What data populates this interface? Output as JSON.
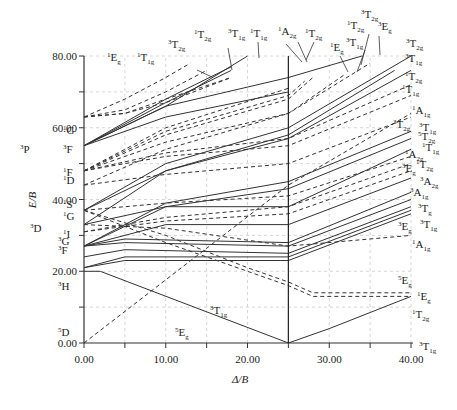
{
  "chart_data": {
    "type": "line",
    "title": "",
    "xlabel": "Δ/B",
    "ylabel": "E/B",
    "xlim": [
      0,
      40
    ],
    "ylim": [
      0,
      80
    ],
    "x_ticks": [
      "0.00",
      "10.00",
      "20.00",
      "30.00",
      "40.00"
    ],
    "y_ticks": [
      "0.00",
      "20.00",
      "40.00",
      "60.00",
      "80.00"
    ],
    "grid": true,
    "critical_delta": 25,
    "left_terms": [
      {
        "label": "5D",
        "y": 0
      },
      {
        "label": "3H",
        "y": 17
      },
      {
        "label": "3F",
        "y": 24
      },
      {
        "label": "3G",
        "y": 27
      },
      {
        "label": "1I",
        "y": 31
      },
      {
        "label": "3D",
        "y": 33
      },
      {
        "label": "1G",
        "y": 37
      },
      {
        "label": "1S",
        "y": 40
      },
      {
        "label": "1D",
        "y": 44
      },
      {
        "label": "1F",
        "y": 48
      },
      {
        "label": "3P",
        "y": 55
      },
      {
        "label": "3F",
        "y": 55
      },
      {
        "label": "1G",
        "y": 63
      }
    ],
    "top_labels": [
      "1Eg",
      "1T1g",
      "3T2g",
      "1T2g",
      "3T1g",
      "1T1g",
      "1A2g",
      "1T2g",
      "1Eg",
      "3T1g",
      "1T2g",
      "3T2g",
      "3Eg"
    ],
    "right_labels": [
      {
        "label": "3T2g",
        "y": 80
      },
      {
        "label": "3T1g",
        "y": 76
      },
      {
        "label": "1T2g",
        "y": 72
      },
      {
        "label": "1T1g",
        "y": 69
      },
      {
        "label": "1A1g",
        "y": 63
      },
      {
        "label": "3T2g",
        "y": 59
      },
      {
        "label": "3T1g",
        "y": 57
      },
      {
        "label": "5T2g",
        "y": 54
      },
      {
        "label": "1T1g",
        "y": 52
      },
      {
        "label": "1A2g",
        "y": 50
      },
      {
        "label": "1T2g",
        "y": 48
      },
      {
        "label": "3Eg",
        "y": 46
      },
      {
        "label": "3A2g",
        "y": 44
      },
      {
        "label": "3A1g",
        "y": 42
      },
      {
        "label": "3Tg",
        "y": 38
      },
      {
        "label": "3T1g",
        "y": 36
      },
      {
        "label": "3Eg",
        "y": 37
      },
      {
        "label": "1A1g",
        "y": 30
      },
      {
        "label": "5Eg",
        "y": 15
      },
      {
        "label": "1Eg",
        "y": 12
      },
      {
        "label": "1T2g",
        "y": 9
      },
      {
        "label": "3T1g",
        "y": 0
      }
    ],
    "inline_labels": [
      {
        "label": "3T1g",
        "x": 21,
        "y": 8
      },
      {
        "label": "5Eg",
        "x": 14,
        "y": 3
      }
    ],
    "series": [
      {
        "name": "5T2g/5Eg ground (5D)",
        "style": "dashed",
        "x": [
          0,
          25,
          40
        ],
        "y": [
          0,
          44,
          64
        ]
      },
      {
        "name": "3T1g (3H)",
        "style": "solid",
        "x": [
          0,
          2,
          25,
          30,
          40
        ],
        "y": [
          20,
          20,
          0,
          4,
          13
        ]
      },
      {
        "name": "1Eg low",
        "style": "dashed",
        "x": [
          0,
          10,
          20,
          25,
          28,
          40
        ],
        "y": [
          37,
          30,
          21,
          17,
          14,
          14
        ]
      },
      {
        "name": "1T2g low",
        "style": "dashed",
        "x": [
          0,
          10,
          20,
          25,
          28,
          40
        ],
        "y": [
          37,
          28,
          20,
          16,
          13,
          13
        ]
      },
      {
        "name": "1A1g",
        "style": "dashed",
        "x": [
          0,
          10,
          25,
          40
        ],
        "y": [
          33,
          32,
          27,
          30
        ]
      },
      {
        "name": "3T1g a",
        "style": "solid",
        "x": [
          0,
          5,
          25,
          40
        ],
        "y": [
          21,
          23,
          23,
          36
        ]
      },
      {
        "name": "3Eg a",
        "style": "solid",
        "x": [
          0,
          5,
          25,
          40
        ],
        "y": [
          21,
          24,
          24,
          37
        ]
      },
      {
        "name": "3Tg",
        "style": "solid",
        "x": [
          0,
          5,
          25,
          40
        ],
        "y": [
          24,
          26,
          25,
          38
        ]
      },
      {
        "name": "3A1g",
        "style": "solid",
        "x": [
          0,
          5,
          25,
          40
        ],
        "y": [
          27,
          28,
          27,
          40
        ]
      },
      {
        "name": "3A2g",
        "style": "solid",
        "x": [
          0,
          5,
          25,
          40
        ],
        "y": [
          27,
          29,
          28,
          42
        ]
      },
      {
        "name": "3Eg b",
        "style": "solid",
        "x": [
          0,
          10,
          25,
          40
        ],
        "y": [
          27,
          33,
          33,
          46
        ]
      },
      {
        "name": "1T2g mid",
        "style": "dashed",
        "x": [
          0,
          10,
          25,
          40
        ],
        "y": [
          31,
          34,
          36,
          48
        ]
      },
      {
        "name": "1A2g",
        "style": "dashed",
        "x": [
          0,
          10,
          25,
          40
        ],
        "y": [
          31,
          35,
          38,
          50
        ]
      },
      {
        "name": "1T1g mid",
        "style": "dashed",
        "x": [
          0,
          10,
          25,
          40
        ],
        "y": [
          37,
          39,
          41,
          52
        ]
      },
      {
        "name": "5T2g",
        "style": "solid",
        "x": [
          0,
          10,
          25,
          40
        ],
        "y": [
          33,
          38,
          38,
          54
        ]
      },
      {
        "name": "3T1g b",
        "style": "solid",
        "x": [
          0,
          10,
          25,
          40
        ],
        "y": [
          27,
          38,
          43,
          57
        ]
      },
      {
        "name": "3T2g b",
        "style": "solid",
        "x": [
          0,
          10,
          25,
          40
        ],
        "y": [
          27,
          39,
          45,
          59
        ]
      },
      {
        "name": "1A1g hi",
        "style": "dashed",
        "x": [
          0,
          10,
          25,
          40
        ],
        "y": [
          44,
          47,
          50,
          63
        ]
      },
      {
        "name": "1T1g hi",
        "style": "dashed",
        "x": [
          0,
          10,
          25,
          40
        ],
        "y": [
          48,
          52,
          55,
          69
        ]
      },
      {
        "name": "1T2g hi",
        "style": "dashed",
        "x": [
          0,
          10,
          25,
          40
        ],
        "y": [
          48,
          53,
          57,
          72
        ]
      },
      {
        "name": "3T1g hi",
        "style": "solid",
        "x": [
          0,
          10,
          25,
          40
        ],
        "y": [
          37,
          48,
          57,
          76
        ]
      },
      {
        "name": "3T2g hi",
        "style": "solid",
        "x": [
          0,
          10,
          25,
          40
        ],
        "y": [
          37,
          50,
          60,
          80
        ]
      },
      {
        "name": "3Eg hi",
        "style": "solid",
        "x": [
          0,
          10,
          25,
          38
        ],
        "y": [
          33,
          48,
          58,
          76
        ]
      },
      {
        "name": "1T2g top",
        "style": "dashed",
        "x": [
          0,
          10,
          25,
          35
        ],
        "y": [
          48,
          56,
          64,
          78
        ]
      },
      {
        "name": "3T1g top",
        "style": "solid",
        "x": [
          0,
          10,
          25,
          34
        ],
        "y": [
          55,
          66,
          74,
          80
        ]
      },
      {
        "name": "1Eg top",
        "style": "dashed",
        "x": [
          0,
          10,
          25,
          32
        ],
        "y": [
          44,
          54,
          64,
          75
        ]
      },
      {
        "name": "3T2g top",
        "style": "solid",
        "x": [
          0,
          10,
          25
        ],
        "y": [
          55,
          63,
          70
        ]
      },
      {
        "name": "1T2g upper",
        "style": "dashed",
        "x": [
          0,
          10,
          25,
          28
        ],
        "y": [
          48,
          58,
          68,
          74
        ]
      },
      {
        "name": "1A2g upper",
        "style": "dashed",
        "x": [
          0,
          10,
          25,
          27
        ],
        "y": [
          48,
          59,
          69,
          73
        ]
      },
      {
        "name": "1T1g upper",
        "style": "dashed",
        "x": [
          0,
          10,
          25
        ],
        "y": [
          48,
          60,
          71
        ]
      },
      {
        "name": "3T1g high",
        "style": "solid",
        "x": [
          0,
          10,
          20
        ],
        "y": [
          55,
          66,
          80
        ]
      },
      {
        "name": "1T2g high",
        "style": "solid",
        "x": [
          0,
          10,
          18
        ],
        "y": [
          55,
          67,
          76
        ]
      },
      {
        "name": "3T2g high",
        "style": "solid",
        "x": [
          0,
          10,
          18
        ],
        "y": [
          55,
          68,
          77
        ]
      },
      {
        "name": "1T1g g",
        "style": "dashed",
        "x": [
          0,
          5,
          10,
          15
        ],
        "y": [
          63,
          65,
          70,
          76
        ]
      },
      {
        "name": "1Eg g",
        "style": "dashed",
        "x": [
          0,
          5,
          10,
          13
        ],
        "y": [
          63,
          68,
          74,
          78
        ]
      },
      {
        "name": "1T2g g",
        "style": "dashed",
        "x": [
          0,
          5,
          10,
          18
        ],
        "y": [
          63,
          64,
          68,
          74
        ]
      },
      {
        "name": "1A1g g",
        "style": "dashed",
        "x": [
          0,
          5,
          10,
          18
        ],
        "y": [
          63,
          64,
          67,
          74
        ]
      }
    ]
  }
}
